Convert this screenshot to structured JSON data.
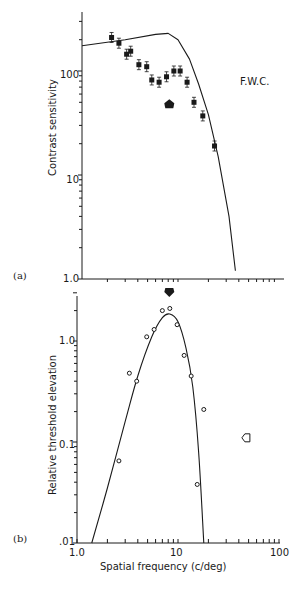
{
  "chart_data": [
    {
      "panel": "(a)",
      "type": "scatter",
      "title": "",
      "annotation": "F.W.C.",
      "xlabel": "",
      "ylabel": "Contrast sensitivity",
      "xscale": "log",
      "yscale": "log",
      "xlim": [
        1.0,
        100
      ],
      "ylim": [
        1.0,
        400
      ],
      "y_tick_labels": [
        "1.0",
        "10",
        "100"
      ],
      "series": [
        {
          "name": "measured contrast sensitivity (filled squares with error bars)",
          "x": [
            2.2,
            2.6,
            3.1,
            3.4,
            4.1,
            4.9,
            5.5,
            6.5,
            7.7,
            9.1,
            10.5,
            12.3,
            14.4,
            17.6,
            23.0
          ],
          "y": [
            210,
            185,
            145,
            155,
            115,
            110,
            82,
            78,
            88,
            100,
            100,
            78,
            50,
            37,
            19
          ]
        },
        {
          "name": "fitted curve",
          "type": "line",
          "x": [
            1.0,
            3.0,
            6.0,
            8.0,
            10.0,
            13.0,
            16.0,
            20.0,
            25.0,
            32.0,
            37.0
          ],
          "y": [
            175,
            200,
            225,
            230,
            200,
            130,
            75,
            38,
            15,
            4,
            1.2
          ]
        },
        {
          "name": "adaptation frequency marker (filled arrow)",
          "x": [
            8.2
          ],
          "y": [
            48
          ]
        }
      ]
    },
    {
      "panel": "(b)",
      "type": "scatter",
      "title": "",
      "xlabel": "Spatial frequency (c/deg)",
      "ylabel": "Relative threshold elevation",
      "xscale": "log",
      "yscale": "log",
      "xlim": [
        1.0,
        100
      ],
      "ylim": [
        0.01,
        3.0
      ],
      "x_tick_labels": [
        "1.0",
        "10",
        "100"
      ],
      "y_tick_labels": [
        ".01",
        "0.1",
        "1.0"
      ],
      "series": [
        {
          "name": "threshold elevation (open circles)",
          "x": [
            2.6,
            3.3,
            3.9,
            4.9,
            5.8,
            7.0,
            8.3,
            9.8,
            11.5,
            13.5,
            15.5,
            18.0
          ],
          "y": [
            0.065,
            0.48,
            0.4,
            1.1,
            1.3,
            2.0,
            2.1,
            1.45,
            0.72,
            0.45,
            0.038,
            0.21
          ]
        },
        {
          "name": "fitted curve",
          "type": "line",
          "x": [
            1.4,
            2.0,
            3.0,
            4.0,
            5.5,
            7.0,
            8.3,
            10.0,
            12.0,
            14.0,
            16.0,
            18.0
          ],
          "y": [
            0.01,
            0.035,
            0.16,
            0.45,
            1.1,
            1.7,
            1.85,
            1.55,
            0.85,
            0.35,
            0.08,
            0.01
          ]
        },
        {
          "name": "adaptation frequency marker (filled arrow)",
          "x": [
            8.2
          ],
          "y": [
            3.0
          ]
        },
        {
          "name": "open arrow marker",
          "x": [
            47
          ],
          "y": [
            0.11
          ]
        }
      ]
    }
  ],
  "labels": {
    "panel_a": "(a)",
    "panel_b": "(b)",
    "subject": "F.W.C.",
    "ylabel_a": "Contrast sensitivity",
    "ylabel_b": "Relative threshold elevation",
    "xlabel": "Spatial frequency (c/deg)",
    "a_y_ticks": {
      "t100": "100",
      "t10": "10",
      "t1": "1.0"
    },
    "b_y_ticks": {
      "t1": "1.0",
      "t01": "0.1",
      "t001": ".01"
    },
    "x_ticks": {
      "t1": "1.0",
      "t10": "10",
      "t100": "100"
    }
  }
}
